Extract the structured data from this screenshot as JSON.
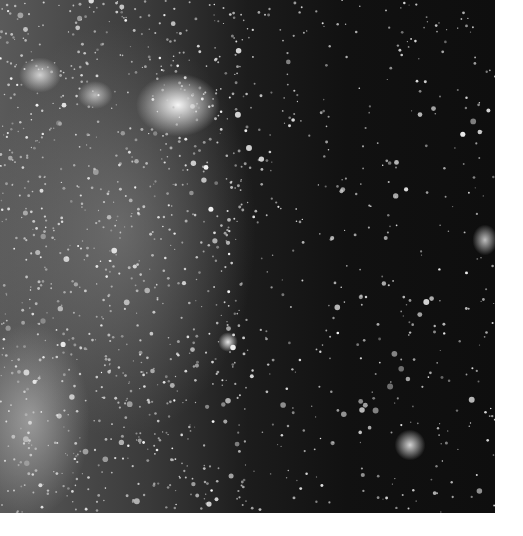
{
  "image": {
    "description": "Grayscale astronomical photograph of a dense star field with bright nebulous clusters",
    "background_color": "#0e0e0e",
    "border_color": "#ffffff",
    "image_area": {
      "x": 0,
      "y": 0,
      "width": 495,
      "height": 513
    },
    "bright_regions": [
      {
        "name": "central-bright-nebula",
        "x": 178,
        "y": 105
      },
      {
        "name": "upper-left-cluster",
        "x": 40,
        "y": 75
      },
      {
        "name": "lower-right-cluster",
        "x": 410,
        "y": 445
      },
      {
        "name": "right-edge-cluster",
        "x": 485,
        "y": 240
      },
      {
        "name": "center-bright-star",
        "x": 228,
        "y": 342
      },
      {
        "name": "lower-left-diffuse-glow",
        "x": 30,
        "y": 420
      }
    ]
  }
}
